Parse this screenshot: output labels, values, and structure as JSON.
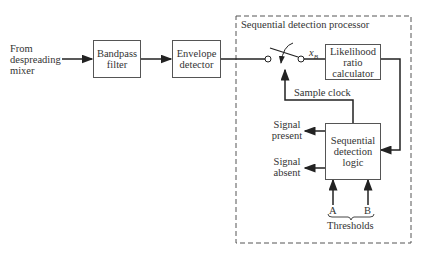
{
  "diagram": {
    "input_label": [
      "From",
      "despreading",
      "mixer"
    ],
    "blocks": {
      "bandpass": [
        "Bandpass",
        "filter"
      ],
      "envelope": [
        "Envelope",
        "detector"
      ],
      "likelihood": [
        "Likelihood",
        "ratio",
        "calculator"
      ],
      "logic": [
        "Sequential",
        "detection",
        "logic"
      ]
    },
    "processor_title": "Sequential detection processor",
    "switch_output_label": "x",
    "switch_output_subscript": "B",
    "sample_clock_label": "Sample clock",
    "outputs": {
      "present": [
        "Signal",
        "present"
      ],
      "absent": [
        "Signal",
        "absent"
      ]
    },
    "thresholds": {
      "a": "A",
      "b": "B",
      "label": "Thresholds"
    }
  }
}
